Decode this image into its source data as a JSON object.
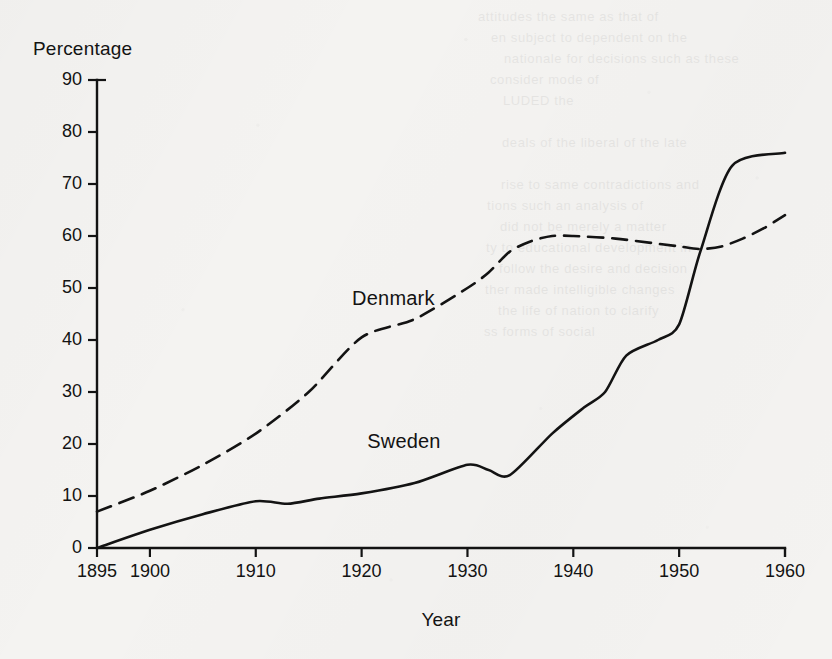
{
  "figure": {
    "background_color": "#f4f3f1",
    "ink_color": "#131313"
  },
  "chart_data": {
    "type": "line",
    "title": "",
    "subtitle": "",
    "xlabel": "Year",
    "ylabel": "Percentage",
    "xlim": [
      1895,
      1960
    ],
    "ylim": [
      0,
      90
    ],
    "grid": false,
    "legend_position": "inline-annotation",
    "xticks": [
      1895,
      1900,
      1910,
      1920,
      1930,
      1940,
      1950,
      1960
    ],
    "xtick_labels": [
      "1895",
      "1900",
      "1910",
      "1920",
      "1930",
      "1940",
      "1950",
      "1960"
    ],
    "yticks": [
      0,
      10,
      20,
      30,
      40,
      50,
      60,
      70,
      80,
      90
    ],
    "ytick_labels": [
      "0",
      "10",
      "20",
      "30",
      "40",
      "50",
      "60",
      "70",
      "80",
      "90"
    ],
    "series": [
      {
        "name": "Denmark",
        "style": "dashed",
        "color": "#131313",
        "label_position": {
          "x": 1923,
          "y": 48
        },
        "x": [
          1895,
          1900,
          1905,
          1910,
          1915,
          1920,
          1925,
          1930,
          1932,
          1934,
          1936,
          1938,
          1940,
          1944,
          1948,
          1950,
          1952,
          1954,
          1956,
          1958,
          1960
        ],
        "values": [
          7,
          11,
          16,
          22,
          30,
          40.5,
          44,
          50,
          53,
          57,
          59,
          60,
          60,
          59.5,
          58.5,
          58,
          57.5,
          58,
          59.5,
          61.5,
          64
        ]
      },
      {
        "name": "Sweden",
        "style": "solid",
        "color": "#131313",
        "label_position": {
          "x": 1924,
          "y": 20.5
        },
        "x": [
          1895,
          1900,
          1905,
          1910,
          1913,
          1916,
          1920,
          1925,
          1930,
          1932,
          1934,
          1938,
          1941,
          1943,
          1945,
          1948,
          1950,
          1952,
          1955,
          1960
        ],
        "values": [
          0,
          3.5,
          6.5,
          9,
          8.5,
          9.5,
          10.5,
          12.5,
          16,
          15,
          14,
          22,
          27,
          30,
          37,
          40,
          43,
          57,
          73.5,
          76
        ]
      }
    ],
    "annotations": [
      {
        "text": "Denmark",
        "series": "Denmark"
      },
      {
        "text": "Sweden",
        "series": "Sweden"
      }
    ]
  },
  "bleed_through": {
    "lines": [
      "attitudes                  the same as that of",
      "en subject to                 dependent on the",
      "nationale  for   decisions     such   as   these",
      "consider                    mode of",
      "LUDED                                          the",
      "",
      "deals of the liberal                  of the late",
      "",
      "rise to       same contradictions and",
      "tions                      such an analysis of",
      "did not                   be merely a matter",
      "ty  to       educational   development   in",
      "follow the desire                and decision",
      "ther   made   intelligible     changes",
      "the  life  of     nation        to  clarify",
      "ss       forms  of  social"
    ]
  }
}
